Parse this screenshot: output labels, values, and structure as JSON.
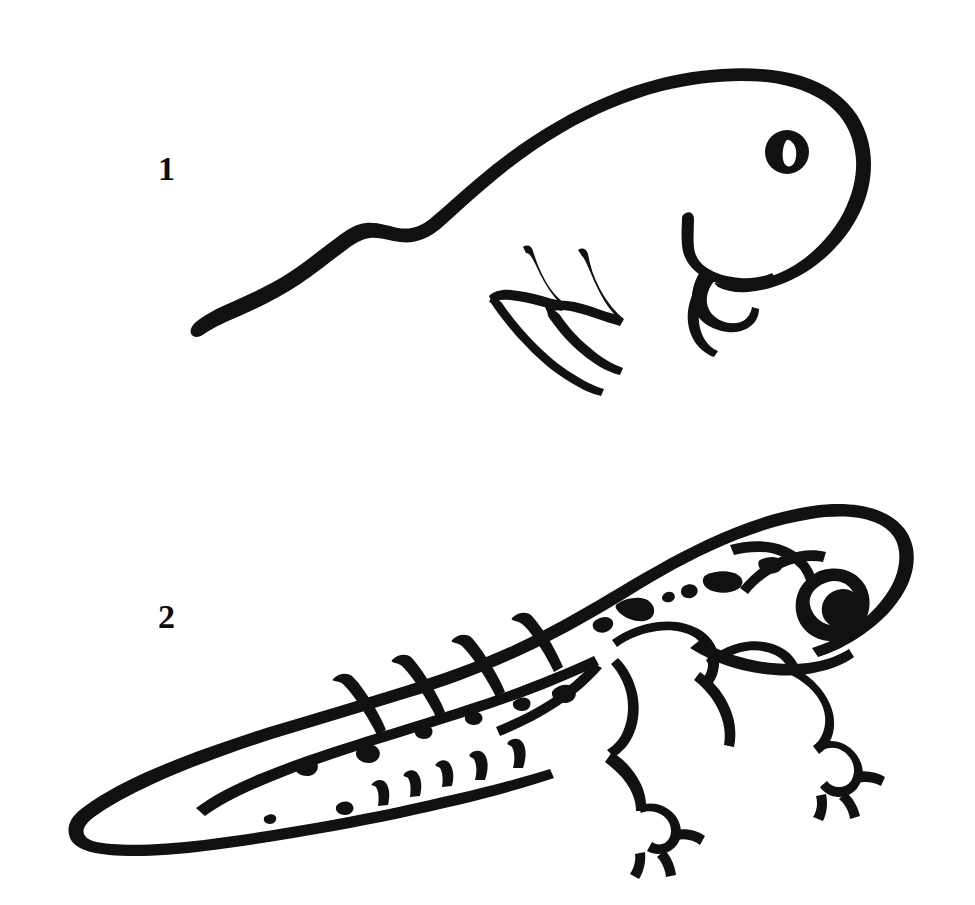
{
  "page": {
    "background_color": "#ffffff",
    "ink_color": "#111111",
    "width": 975,
    "height": 905,
    "style": "black-and-white ink line drawing, clip-art / coloring-book style"
  },
  "figures": [
    {
      "number": "1",
      "label": "1",
      "label_position": {
        "x": 158,
        "y": 152
      },
      "subject": "tadpole",
      "description": "Tadpole with rounded head, large round eye with white slit pupil, long tapering wavy tail, and small zigzag limb buds beneath the body",
      "parts": [
        "head-outline",
        "eye",
        "pupil-highlight",
        "tail",
        "front-limb-bud",
        "hind-limb-bud-zigzag-1",
        "hind-limb-bud-zigzag-2"
      ]
    },
    {
      "number": "2",
      "label": "2",
      "label_position": {
        "x": 158,
        "y": 600
      },
      "subject": "froglet",
      "description": "Froglet with broad head, outlined eye with white crescent highlight, four developed webbed legs with toes, speckled back, and a large segmented tail fin still attached",
      "parts": [
        "body-outline",
        "head-outline",
        "eye-outline",
        "eye-highlight",
        "brow-line",
        "speckle-dashes",
        "front-leg-left",
        "front-leg-right",
        "hind-leg",
        "webbed-foot-front",
        "webbed-foot-hind",
        "tail-fin-outline",
        "tail-fin-segments",
        "tail-speckles"
      ]
    }
  ],
  "caption": {
    "text": "",
    "visible": false
  }
}
